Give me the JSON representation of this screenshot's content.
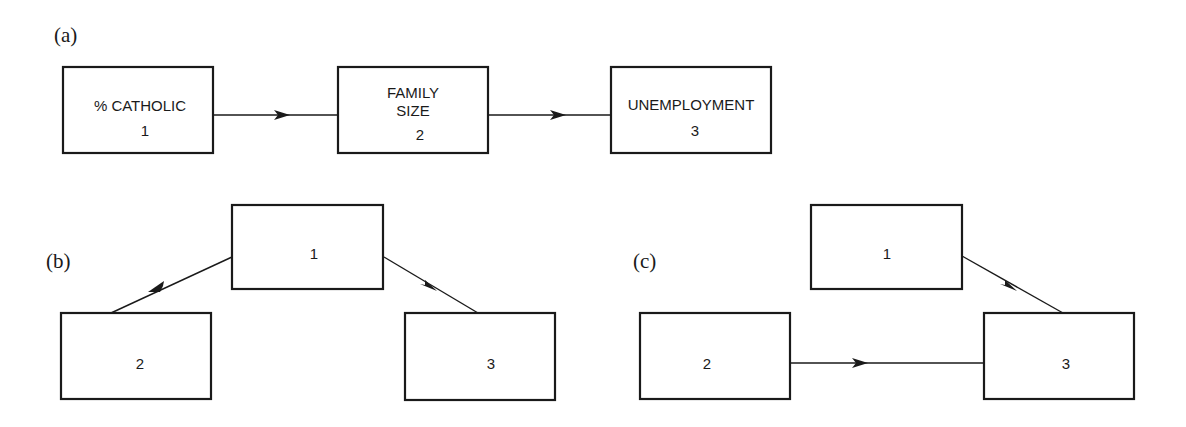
{
  "panels": {
    "a": {
      "label": "(a)",
      "nodes": {
        "n1": {
          "lines": [
            "% CATHOLIC"
          ],
          "number": "1"
        },
        "n2": {
          "lines": [
            "FAMILY",
            "SIZE"
          ],
          "number": "2"
        },
        "n3": {
          "lines": [
            "UNEMPLOYMENT"
          ],
          "number": "3"
        }
      },
      "edges": [
        {
          "from": "1",
          "to": "2"
        },
        {
          "from": "2",
          "to": "3"
        }
      ]
    },
    "b": {
      "label": "(b)",
      "nodes": {
        "n1": {
          "number": "1"
        },
        "n2": {
          "number": "2"
        },
        "n3": {
          "number": "3"
        }
      },
      "edges": [
        {
          "from": "1",
          "to": "2"
        },
        {
          "from": "1",
          "to": "3"
        }
      ]
    },
    "c": {
      "label": "(c)",
      "nodes": {
        "n1": {
          "number": "1"
        },
        "n2": {
          "number": "2"
        },
        "n3": {
          "number": "3"
        }
      },
      "edges": [
        {
          "from": "1",
          "to": "3"
        },
        {
          "from": "2",
          "to": "3"
        }
      ]
    }
  }
}
